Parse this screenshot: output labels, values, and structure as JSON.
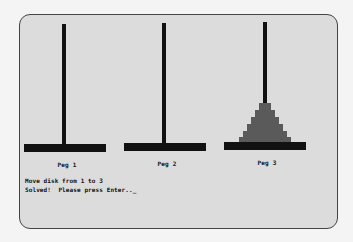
{
  "game": {
    "title": "Tower of Hanoi",
    "pegs": [
      {
        "label": "Peg 1",
        "disks": 0
      },
      {
        "label": "Peg 2",
        "disks": 0
      },
      {
        "label": "Peg 3",
        "disks": 6
      }
    ],
    "messages": {
      "last_move": "Move disk from 1 to 3",
      "status": "Solved!  Please press Enter.._"
    },
    "colors": {
      "background": "#dcdcdc",
      "pole": "#111111",
      "disk": "#5a5a5a"
    }
  }
}
